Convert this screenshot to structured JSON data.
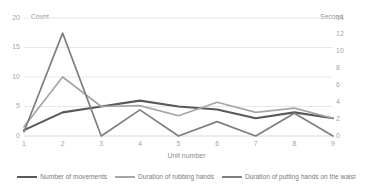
{
  "chart_data": {
    "type": "line",
    "title": "",
    "xlabel": "Unit number",
    "categories": [
      "1",
      "2",
      "3",
      "4",
      "5",
      "6",
      "7",
      "8",
      "9"
    ],
    "x": [
      1,
      2,
      3,
      4,
      5,
      6,
      7,
      8,
      9
    ],
    "grid": true,
    "legend_position": "bottom",
    "axes": {
      "left": {
        "label": "Count",
        "ticks": [
          "0",
          "5",
          "10",
          "15",
          "20"
        ],
        "tick_values": [
          0,
          5,
          10,
          15,
          20
        ],
        "ylim": [
          0,
          20
        ]
      },
      "right": {
        "label": "Second",
        "ticks": [
          "0",
          "2",
          "4",
          "6",
          "8",
          "10",
          "12",
          "14"
        ],
        "tick_values": [
          0,
          2,
          4,
          6,
          8,
          10,
          12,
          14
        ],
        "ylim": [
          0,
          14
        ]
      }
    },
    "series": [
      {
        "name": "Number of movements",
        "axis": "left",
        "unit": "Count",
        "color": "#595959",
        "width": 2.1,
        "values": [
          1,
          4,
          5,
          6,
          5,
          4.5,
          3,
          4,
          3
        ]
      },
      {
        "name": "Duration of rubbing hands",
        "axis": "right",
        "unit": "Second",
        "color": "#a6a6a6",
        "width": 1.7,
        "values": [
          1.1,
          7.0,
          3.5,
          3.6,
          2.4,
          4.0,
          2.8,
          3.3,
          2.1
        ]
      },
      {
        "name": "Duration of putting hands on the waist",
        "axis": "right",
        "unit": "Second",
        "color": "#7f7f7f",
        "width": 1.7,
        "values": [
          0.5,
          12.2,
          0,
          3.1,
          0,
          1.7,
          0,
          2.7,
          0
        ]
      }
    ]
  },
  "legend": {
    "items": [
      {
        "label": "Number of movements"
      },
      {
        "label": "Duration of rubbing hands"
      },
      {
        "label": "Duration of putting hands on the waist"
      }
    ]
  }
}
